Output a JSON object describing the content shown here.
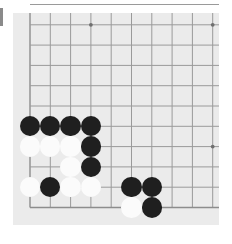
{
  "app": {
    "title": "go-board-corner",
    "canvas": {
      "width": 232,
      "height": 244
    }
  },
  "colors": {
    "page_background": "#ffffff",
    "board_background": "#ebebeb",
    "grid_line": "#9a9a9a",
    "grid_line_edge": "#8d8d8d",
    "star_point": "#6f6f6f",
    "black_stone": "#1f1f1f",
    "white_stone": "#fbfbfb",
    "edge_bar": "#8a8a8a"
  },
  "board": {
    "name": "go-board",
    "origin_x": 30.0,
    "origin_y": 4.5,
    "spacing": 20.3,
    "cols": 10,
    "rows": 11,
    "surface": {
      "left": 13,
      "top": 13,
      "width": 206,
      "height": 212
    },
    "stone_radius": 10.2,
    "star_points": [
      {
        "col": 3,
        "row": 1
      },
      {
        "col": 9,
        "row": 1
      },
      {
        "col": 9,
        "row": 7
      }
    ],
    "edges": {
      "left_col": 0,
      "bottom_row": 10
    }
  },
  "stones": [
    {
      "color": "black",
      "col": 0,
      "row": 6
    },
    {
      "color": "black",
      "col": 1,
      "row": 6
    },
    {
      "color": "black",
      "col": 2,
      "row": 6
    },
    {
      "color": "black",
      "col": 3,
      "row": 6
    },
    {
      "color": "white",
      "col": 0,
      "row": 7
    },
    {
      "color": "white",
      "col": 1,
      "row": 7
    },
    {
      "color": "white",
      "col": 2,
      "row": 7
    },
    {
      "color": "black",
      "col": 3,
      "row": 7
    },
    {
      "color": "white",
      "col": 2,
      "row": 8
    },
    {
      "color": "black",
      "col": 3,
      "row": 8
    },
    {
      "color": "white",
      "col": 0,
      "row": 9
    },
    {
      "color": "black",
      "col": 1,
      "row": 9
    },
    {
      "color": "white",
      "col": 2,
      "row": 9
    },
    {
      "color": "white",
      "col": 3,
      "row": 9
    },
    {
      "color": "black",
      "col": 5,
      "row": 9
    },
    {
      "color": "black",
      "col": 6,
      "row": 9
    },
    {
      "color": "white",
      "col": 5,
      "row": 10
    },
    {
      "color": "black",
      "col": 6,
      "row": 10
    }
  ]
}
